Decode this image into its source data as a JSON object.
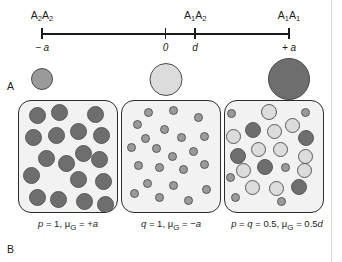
{
  "figure": {
    "panels": [
      {
        "letter": "A",
        "name": "genotypic-value-scale"
      },
      {
        "letter": "B",
        "name": "population-genotype-distributions"
      }
    ]
  },
  "colors": {
    "genotype_A1A1": "#6e6e6e",
    "genotype_A1A2": "#d8d8d8",
    "genotype_A2A2": "#9a9a9a",
    "outline": "#5a5a5a",
    "box_fill": "#f2f2f2",
    "box_border": "#2b2b2b",
    "axis": "#1c1c1c"
  },
  "panel_a": {
    "axis": {
      "ticks": [
        {
          "id": "tick-minus-a",
          "x_pct": 0,
          "top_label": "A2A2",
          "top_label_html": "A<sub>2</sub>A<sub>2</sub>",
          "bottom_label": "− a"
        },
        {
          "id": "tick-zero",
          "x_pct": 50,
          "top_label": "",
          "top_label_html": "",
          "bottom_label": "0"
        },
        {
          "id": "tick-d",
          "x_pct": 62,
          "top_label": "A1A2",
          "top_label_html": "A<sub>1</sub>A<sub>2</sub>",
          "bottom_label": "d"
        },
        {
          "id": "tick-plus-a",
          "x_pct": 100,
          "top_label": "A1A1",
          "top_label_html": "A<sub>1</sub>A<sub>1</sub>",
          "bottom_label": "+ a"
        }
      ]
    },
    "reference_circles": [
      {
        "id": "ref-circle-A2A2",
        "genotype": "A2A2",
        "x_pct": 0,
        "diameter": 22,
        "fill": "#9a9a9a"
      },
      {
        "id": "ref-circle-A1A2",
        "genotype": "A1A2",
        "x_pct": 50,
        "diameter": 33,
        "fill": "#dcdcdc"
      },
      {
        "id": "ref-circle-A1A1",
        "genotype": "A1A1",
        "x_pct": 100,
        "diameter": 42,
        "fill": "#6e6e6e"
      }
    ]
  },
  "panel_b": {
    "populations": [
      {
        "id": "population-p1",
        "caption": "p = 1, μG = +a",
        "caption_html": "<i>p</i> = 1, μ<sub>G</sub> = +<i>a</i>",
        "allele_freq_p": 1,
        "allele_freq_q": 0,
        "mean_genotypic_value": "+a",
        "box_left": 18,
        "caption_center": 68,
        "dots": [
          {
            "x": 10,
            "y": 6,
            "d": 17,
            "fill": "#6e6e6e"
          },
          {
            "x": 32,
            "y": 3,
            "d": 17,
            "fill": "#6e6e6e"
          },
          {
            "x": 68,
            "y": 5,
            "d": 17,
            "fill": "#6e6e6e"
          },
          {
            "x": 6,
            "y": 28,
            "d": 17,
            "fill": "#6e6e6e"
          },
          {
            "x": 29,
            "y": 26,
            "d": 17,
            "fill": "#6e6e6e"
          },
          {
            "x": 51,
            "y": 22,
            "d": 17,
            "fill": "#6e6e6e"
          },
          {
            "x": 74,
            "y": 26,
            "d": 17,
            "fill": "#6e6e6e"
          },
          {
            "x": 56,
            "y": 44,
            "d": 17,
            "fill": "#6e6e6e"
          },
          {
            "x": 19,
            "y": 49,
            "d": 17,
            "fill": "#6e6e6e"
          },
          {
            "x": 39,
            "y": 54,
            "d": 17,
            "fill": "#6e6e6e"
          },
          {
            "x": 72,
            "y": 50,
            "d": 17,
            "fill": "#6e6e6e"
          },
          {
            "x": 4,
            "y": 66,
            "d": 17,
            "fill": "#6e6e6e"
          },
          {
            "x": 51,
            "y": 70,
            "d": 17,
            "fill": "#6e6e6e"
          },
          {
            "x": 76,
            "y": 72,
            "d": 17,
            "fill": "#6e6e6e"
          },
          {
            "x": 10,
            "y": 88,
            "d": 17,
            "fill": "#6e6e6e"
          },
          {
            "x": 31,
            "y": 90,
            "d": 17,
            "fill": "#6e6e6e"
          },
          {
            "x": 57,
            "y": 92,
            "d": 17,
            "fill": "#6e6e6e"
          },
          {
            "x": 78,
            "y": 95,
            "d": 17,
            "fill": "#6e6e6e"
          }
        ]
      },
      {
        "id": "population-q1",
        "caption": "q = 1, μG = −a",
        "caption_html": "<i>q</i> = 1, μ<sub>G</sub> = −<i>a</i>",
        "allele_freq_p": 0,
        "allele_freq_q": 1,
        "mean_genotypic_value": "−a",
        "box_left": 121,
        "caption_center": 171,
        "dots": [
          {
            "x": 22,
            "y": 7,
            "d": 9,
            "fill": "#9a9a9a"
          },
          {
            "x": 47,
            "y": 5,
            "d": 9,
            "fill": "#9a9a9a"
          },
          {
            "x": 72,
            "y": 12,
            "d": 9,
            "fill": "#9a9a9a"
          },
          {
            "x": 11,
            "y": 19,
            "d": 9,
            "fill": "#9a9a9a"
          },
          {
            "x": 38,
            "y": 24,
            "d": 9,
            "fill": "#9a9a9a"
          },
          {
            "x": 19,
            "y": 33,
            "d": 9,
            "fill": "#9a9a9a"
          },
          {
            "x": 55,
            "y": 32,
            "d": 9,
            "fill": "#9a9a9a"
          },
          {
            "x": 78,
            "y": 31,
            "d": 9,
            "fill": "#9a9a9a"
          },
          {
            "x": 5,
            "y": 42,
            "d": 9,
            "fill": "#9a9a9a"
          },
          {
            "x": 30,
            "y": 43,
            "d": 9,
            "fill": "#9a9a9a"
          },
          {
            "x": 46,
            "y": 51,
            "d": 9,
            "fill": "#9a9a9a"
          },
          {
            "x": 67,
            "y": 46,
            "d": 9,
            "fill": "#9a9a9a"
          },
          {
            "x": 12,
            "y": 60,
            "d": 9,
            "fill": "#9a9a9a"
          },
          {
            "x": 33,
            "y": 62,
            "d": 9,
            "fill": "#9a9a9a"
          },
          {
            "x": 57,
            "y": 64,
            "d": 9,
            "fill": "#9a9a9a"
          },
          {
            "x": 78,
            "y": 59,
            "d": 9,
            "fill": "#9a9a9a"
          },
          {
            "x": 21,
            "y": 78,
            "d": 9,
            "fill": "#9a9a9a"
          },
          {
            "x": 47,
            "y": 80,
            "d": 9,
            "fill": "#9a9a9a"
          },
          {
            "x": 8,
            "y": 88,
            "d": 9,
            "fill": "#9a9a9a"
          },
          {
            "x": 33,
            "y": 92,
            "d": 9,
            "fill": "#9a9a9a"
          },
          {
            "x": 62,
            "y": 95,
            "d": 9,
            "fill": "#9a9a9a"
          },
          {
            "x": 80,
            "y": 84,
            "d": 9,
            "fill": "#9a9a9a"
          }
        ]
      },
      {
        "id": "population-pq05",
        "caption": "p = q = 0.5, μG = 0.5d",
        "caption_html": "<i>p</i> = <i>q</i> = 0.5, μ<sub>G</sub> = 0.5<i>d</i>",
        "allele_freq_p": 0.5,
        "allele_freq_q": 0.5,
        "mean_genotypic_value": "0.5d",
        "box_left": 224,
        "caption_center": 277,
        "dots": [
          {
            "x": 2,
            "y": 8,
            "d": 9,
            "fill": "#9a9a9a"
          },
          {
            "x": 36,
            "y": 3,
            "d": 16,
            "fill": "#dcdcdc"
          },
          {
            "x": 76,
            "y": 7,
            "d": 9,
            "fill": "#9a9a9a"
          },
          {
            "x": 60,
            "y": 17,
            "d": 15,
            "fill": "#dcdcdc"
          },
          {
            "x": 20,
            "y": 21,
            "d": 16,
            "fill": "#6e6e6e"
          },
          {
            "x": 42,
            "y": 23,
            "d": 15,
            "fill": "#dcdcdc"
          },
          {
            "x": 1,
            "y": 28,
            "d": 15,
            "fill": "#dcdcdc"
          },
          {
            "x": 73,
            "y": 29,
            "d": 16,
            "fill": "#6e6e6e"
          },
          {
            "x": 26,
            "y": 41,
            "d": 15,
            "fill": "#dcdcdc"
          },
          {
            "x": 48,
            "y": 41,
            "d": 15,
            "fill": "#dcdcdc"
          },
          {
            "x": 5,
            "y": 47,
            "d": 16,
            "fill": "#6e6e6e"
          },
          {
            "x": 73,
            "y": 48,
            "d": 15,
            "fill": "#dcdcdc"
          },
          {
            "x": 32,
            "y": 58,
            "d": 16,
            "fill": "#6e6e6e"
          },
          {
            "x": 56,
            "y": 62,
            "d": 9,
            "fill": "#9a9a9a"
          },
          {
            "x": 11,
            "y": 62,
            "d": 15,
            "fill": "#dcdcdc"
          },
          {
            "x": 72,
            "y": 62,
            "d": 15,
            "fill": "#dcdcdc"
          },
          {
            "x": 1,
            "y": 72,
            "d": 9,
            "fill": "#9a9a9a"
          },
          {
            "x": 20,
            "y": 79,
            "d": 15,
            "fill": "#dcdcdc"
          },
          {
            "x": 44,
            "y": 80,
            "d": 15,
            "fill": "#dcdcdc"
          },
          {
            "x": 66,
            "y": 78,
            "d": 16,
            "fill": "#6e6e6e"
          },
          {
            "x": 6,
            "y": 92,
            "d": 9,
            "fill": "#9a9a9a"
          },
          {
            "x": 52,
            "y": 96,
            "d": 9,
            "fill": "#9a9a9a"
          }
        ]
      }
    ]
  }
}
